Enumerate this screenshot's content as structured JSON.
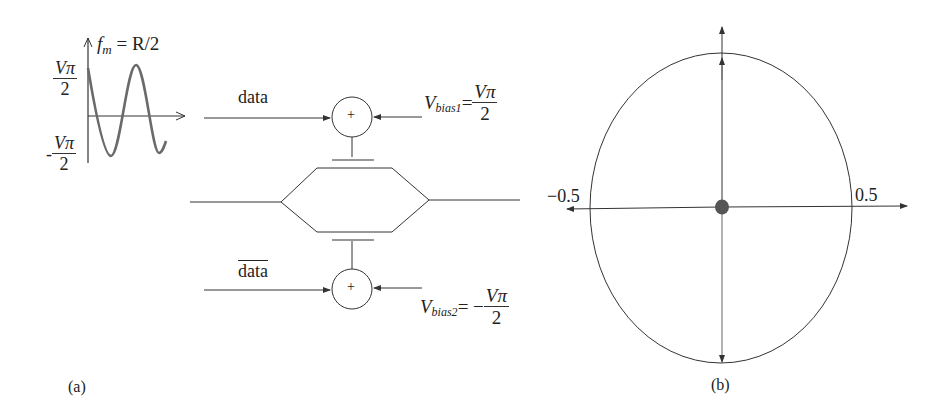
{
  "panel_a": {
    "label": "(a)",
    "waveform": {
      "freq_label_f": "f",
      "freq_label_sub": "m",
      "freq_label_rest": " = R/2",
      "top_level_num": "Vπ",
      "top_level_den": "2",
      "bottom_level_sign": "-",
      "bottom_level_num": "Vπ",
      "bottom_level_den": "2"
    },
    "upper_arm": {
      "input_label": "data",
      "adder_symbol": "+",
      "bias_V": "V",
      "bias_sub": "bias1",
      "bias_eq": "=",
      "bias_sign": "",
      "bias_num": "Vπ",
      "bias_den": "2"
    },
    "lower_arm": {
      "input_label": "data",
      "input_label_overlined": true,
      "adder_symbol": "+",
      "bias_V": "V",
      "bias_sub": "bias2",
      "bias_eq": "=",
      "bias_sign": " −",
      "bias_num": "Vπ",
      "bias_den": "2"
    }
  },
  "panel_b": {
    "label": "(b)",
    "axis_neg_label": "−0.5",
    "axis_pos_label": "0.5"
  },
  "colors": {
    "line": "#333333",
    "waveform": "#6a6a6a",
    "dot": "#555555"
  }
}
